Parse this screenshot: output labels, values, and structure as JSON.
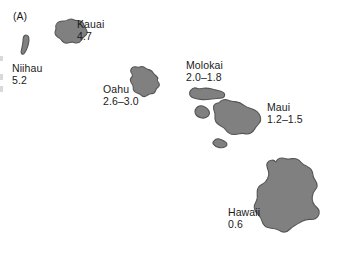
{
  "figure": {
    "panel_label": "(A)",
    "type": "map",
    "region": "Hawaiian Islands",
    "colors": {
      "island_fill": "#808080",
      "island_stroke": "#555555",
      "background": "#ffffff",
      "text": "#1a1a1a"
    }
  },
  "islands": [
    {
      "id": "niihau",
      "name": "Niihau",
      "age": "5.2"
    },
    {
      "id": "kauai",
      "name": "Kauai",
      "age": "4.7"
    },
    {
      "id": "oahu",
      "name": "Oahu",
      "age": "2.6–3.0"
    },
    {
      "id": "molokai",
      "name": "Molokai",
      "age": "2.0–1.8"
    },
    {
      "id": "maui",
      "name": "Maui",
      "age": "1.2–1.5"
    },
    {
      "id": "hawaii",
      "name": "Hawaii",
      "age": "0.6"
    }
  ],
  "unlabeled_landmasses": [
    "lanai",
    "kahoolawe"
  ]
}
